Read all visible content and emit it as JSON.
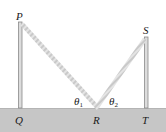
{
  "diagram": {
    "type": "physics-figure",
    "colors": {
      "background": "#ffffff",
      "ground": "#c6c6c6",
      "pole_fill": "#dcdcdc",
      "pole_edge": "#8a8a8a",
      "rope": "#c9c9c9",
      "rope_stripe": "#e6e6e6",
      "label": "#1a1a1a"
    },
    "points": {
      "P": {
        "label": "P",
        "x": 20,
        "y": 22
      },
      "Q": {
        "label": "Q",
        "x": 20,
        "y": 108
      },
      "R": {
        "label": "R",
        "x": 97,
        "y": 108
      },
      "S": {
        "label": "S",
        "x": 146,
        "y": 37
      },
      "T": {
        "label": "T",
        "x": 146,
        "y": 108
      }
    },
    "angles": {
      "theta1": {
        "symbol": "θ",
        "subscript": "1"
      },
      "theta2": {
        "symbol": "θ",
        "subscript": "2"
      }
    }
  }
}
